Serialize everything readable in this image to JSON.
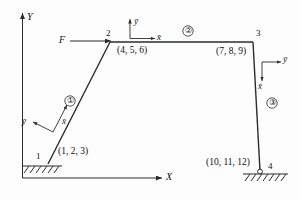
{
  "figure": {
    "type": "structural-frame-diagram"
  },
  "global_axes": {
    "x_label": "X",
    "y_label": "Y",
    "origin_px": [
      22,
      178
    ]
  },
  "load": {
    "label": "F",
    "applied_at_node": "2",
    "direction": "horizontal-right"
  },
  "nodes": [
    {
      "id": "1",
      "label": "1",
      "dof": "(1, 2, 3)",
      "x": 48,
      "y": 164,
      "support": "fixed"
    },
    {
      "id": "2",
      "label": "2",
      "dof": "(4, 5, 6)",
      "x": 110,
      "y": 42,
      "support": "free"
    },
    {
      "id": "3",
      "label": "3",
      "dof": "(7, 8, 9)",
      "x": 253,
      "y": 42,
      "support": "free"
    },
    {
      "id": "4",
      "label": "4",
      "dof": "(10, 11, 12)",
      "x": 260,
      "y": 171,
      "support": "fixed"
    }
  ],
  "elements": [
    {
      "id": "1",
      "label": "①",
      "from": "1",
      "to": "2",
      "marker_px": [
        70,
        101
      ]
    },
    {
      "id": "2",
      "label": "②",
      "from": "2",
      "to": "3",
      "marker_px": [
        188,
        31
      ]
    },
    {
      "id": "3",
      "label": "③",
      "from": "3",
      "to": "4",
      "marker_px": [
        272,
        103
      ]
    }
  ],
  "local_axes": [
    {
      "element": "1",
      "x_label": "x̄",
      "y_label": "ȳ"
    },
    {
      "element": "2",
      "x_label": "x̄",
      "y_label": "ȳ"
    },
    {
      "element": "3",
      "x_label": "x̄",
      "y_label": "ȳ"
    }
  ],
  "colors": {
    "line": "#2b2b2b",
    "text": "#111111",
    "background": "#ffffff"
  }
}
